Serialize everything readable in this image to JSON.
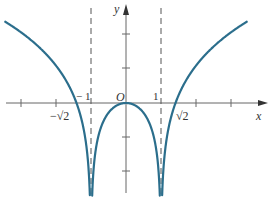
{
  "chart_data": {
    "type": "line",
    "title": "",
    "function": "y = ln|x^2 - 1|",
    "xlabel": "x",
    "ylabel": "y",
    "origin_label": "O",
    "xlim": [
      -3.6,
      4.0
    ],
    "ylim": [
      -2.7,
      2.8
    ],
    "grid": false,
    "legend": null,
    "x_ticks": [
      -3,
      -2,
      -1,
      1,
      2,
      3
    ],
    "y_ticks": [
      -2,
      -1,
      1,
      2
    ],
    "tick_labels": [
      {
        "x": -1,
        "text": "−1"
      },
      {
        "x": 1,
        "text": "1"
      },
      {
        "x": -1.414,
        "text": "−√2"
      },
      {
        "x": 1.414,
        "text": "√2"
      }
    ],
    "asymptotes": [
      {
        "type": "vertical",
        "x": -1,
        "style": "dashed"
      },
      {
        "type": "vertical",
        "x": 1,
        "style": "dashed"
      }
    ],
    "zeros": [
      -1.414,
      0,
      1.414
    ],
    "series": [
      {
        "name": "left branch",
        "domain": [
          -3.45,
          -1
        ],
        "color": "#2b6e8c"
      },
      {
        "name": "middle branch",
        "domain": [
          -1,
          1
        ],
        "color": "#2b6e8c"
      },
      {
        "name": "right branch",
        "domain": [
          1,
          3.45
        ],
        "color": "#2b6e8c"
      }
    ],
    "sample_points": [
      {
        "x": -3.45,
        "y": 2.39
      },
      {
        "x": -2,
        "y": 1.1
      },
      {
        "x": -1.414,
        "y": 0
      },
      {
        "x": 0,
        "y": 0
      },
      {
        "x": 1.414,
        "y": 0
      },
      {
        "x": 2,
        "y": 1.1
      },
      {
        "x": 3.45,
        "y": 2.39
      }
    ]
  },
  "labels": {
    "x_axis": "x",
    "y_axis": "y",
    "origin": "O",
    "neg_one": "− 1",
    "one": "1",
    "neg_sqrt2": "−√2",
    "sqrt2": "√2"
  },
  "colors": {
    "curve": "#2b6e8c",
    "axis": "#555555",
    "asymptote": "#555555"
  }
}
